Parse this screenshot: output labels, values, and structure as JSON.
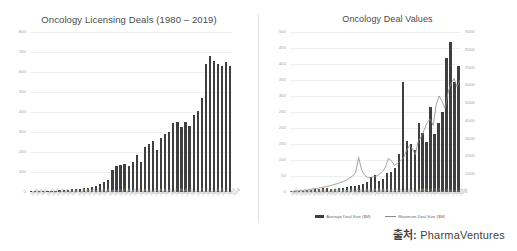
{
  "source": {
    "label": "출처:",
    "name": "PharmaVentures"
  },
  "charts": {
    "left": {
      "title": "Oncology Licensing Deals (1980 – 2019)"
    },
    "right": {
      "title": "Oncology Deal Values",
      "legend": [
        {
          "name": "legend-average-deal-size",
          "label": "Average Deal Size ($M)",
          "marker": "bar",
          "color": "#3f3f3f"
        },
        {
          "name": "legend-maximum-deal-size",
          "label": "Maximum Deal Size ($M)",
          "marker": "line",
          "color": "#8c8c8c"
        }
      ]
    }
  },
  "chart_data": [
    {
      "type": "bar",
      "id": "oncology-licensing-deals",
      "title": "Oncology Licensing Deals (1980 – 2019)",
      "xlabel": "",
      "ylabel": "",
      "ylim": [
        0,
        800
      ],
      "yticks": [
        0,
        100,
        200,
        300,
        400,
        500,
        600,
        700,
        800
      ],
      "ytick_labels": [
        "0",
        "100",
        "200",
        "300",
        "400",
        "500",
        "600",
        "700",
        "800"
      ],
      "grid": true,
      "legend": "none",
      "bar_color": "#3f3f3f",
      "categories": [
        "1980",
        "1981",
        "1982",
        "1983",
        "1984",
        "1985",
        "1986",
        "1987",
        "1988",
        "1989",
        "1990",
        "1991",
        "1992",
        "1993",
        "1994",
        "1995",
        "1996",
        "1997",
        "1998",
        "1999",
        "2000",
        "2001",
        "2002",
        "2003",
        "2004",
        "2005",
        "2006",
        "2007",
        "2008",
        "2009",
        "2010",
        "2011",
        "2012",
        "2013",
        "2014",
        "2015",
        "2016",
        "2017",
        "2018",
        "2019"
      ],
      "values": [
        2,
        3,
        4,
        5,
        5,
        6,
        7,
        8,
        9,
        11,
        13,
        15,
        16,
        18,
        22,
        25,
        30,
        38,
        48,
        60,
        110,
        130,
        135,
        140,
        128,
        150,
        185,
        148,
        225,
        240,
        255,
        210,
        270,
        290,
        300,
        345,
        348,
        325,
        350,
        330,
        385,
        405,
        470,
        640,
        680,
        655,
        640,
        630,
        648,
        632
      ]
    },
    {
      "type": "bar+line",
      "id": "oncology-deal-values",
      "title": "Oncology Deal Values",
      "xlabel": "",
      "grid": true,
      "legend": "bottom",
      "primary_axis": {
        "name": "Average Deal Size ($M)",
        "ylim": [
          0,
          500
        ],
        "yticks": [
          0,
          50,
          100,
          150,
          200,
          250,
          300,
          350,
          400,
          450,
          500
        ],
        "ytick_labels": [
          "0",
          "50",
          "100",
          "150",
          "200",
          "250",
          "300",
          "350",
          "400",
          "450",
          "500"
        ],
        "side": "left",
        "render": "bar",
        "color": "#3f3f3f"
      },
      "secondary_axis": {
        "name": "Maximum Deal Size ($M)",
        "ylim": [
          0,
          9000
        ],
        "yticks": [
          0,
          1000,
          2000,
          3000,
          4000,
          5000,
          6000,
          7000,
          8000,
          9000
        ],
        "ytick_labels": [
          "0",
          "1000",
          "2000",
          "3000",
          "4000",
          "5000",
          "6000",
          "7000",
          "8000",
          "9000"
        ],
        "side": "right",
        "render": "line",
        "color": "#8c8c8c"
      },
      "categories": [
        "1980",
        "1981",
        "1982",
        "1983",
        "1984",
        "1985",
        "1986",
        "1987",
        "1988",
        "1989",
        "1990",
        "1991",
        "1992",
        "1993",
        "1994",
        "1995",
        "1996",
        "1997",
        "1998",
        "1999",
        "2000",
        "2001",
        "2002",
        "2003",
        "2004",
        "2005",
        "2006",
        "2007",
        "2008",
        "2009",
        "2010",
        "2011",
        "2012",
        "2013",
        "2014",
        "2015",
        "2016",
        "2017",
        "2018",
        "2019"
      ],
      "series": [
        {
          "name": "Average Deal Size ($M)",
          "axis": "primary",
          "values": [
            2,
            3,
            3,
            4,
            5,
            6,
            8,
            10,
            14,
            12,
            10,
            9,
            12,
            14,
            16,
            20,
            18,
            22,
            26,
            30,
            48,
            52,
            35,
            40,
            58,
            62,
            75,
            120,
            345,
            160,
            150,
            130,
            215,
            185,
            155,
            265,
            180,
            215,
            250,
            420,
            470,
            345,
            395
          ]
        },
        {
          "name": "Maximum Deal Size ($M)",
          "axis": "secondary",
          "values": [
            30,
            40,
            50,
            60,
            80,
            100,
            120,
            150,
            180,
            200,
            230,
            260,
            300,
            340,
            380,
            430,
            480,
            540,
            600,
            680,
            780,
            900,
            1100,
            1950,
            1250,
            950,
            820,
            780,
            860,
            900,
            1000,
            1150,
            1400,
            1900,
            1750,
            1500,
            1600,
            1750,
            1900,
            2300,
            2600,
            2450,
            2100,
            2850,
            3100,
            3500,
            3900,
            4100,
            3750,
            4900,
            5400,
            5100,
            4700,
            5600,
            6100,
            6400,
            5900,
            6300
          ]
        }
      ]
    }
  ]
}
